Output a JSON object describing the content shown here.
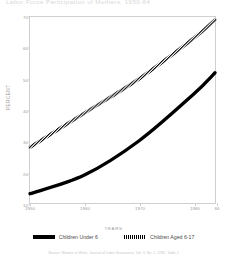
{
  "title": "Labor Force Participation of Mothers, 1950-84",
  "chart_data": {
    "type": "line",
    "title": "Labor Force Participation of Mothers, 1950-84",
    "xlabel": "YEARS",
    "ylabel": "PERCENT",
    "xlim": [
      1950,
      1984
    ],
    "ylim": [
      10,
      70
    ],
    "ytick_values": [
      70,
      60,
      50,
      40,
      30,
      20,
      10
    ],
    "ytick_labels": [
      "70",
      "60",
      "50",
      "40",
      "30",
      "20",
      "10"
    ],
    "xtick_values": [
      1950,
      1960,
      1970,
      1980,
      1984
    ],
    "xtick_labels": [
      "1950",
      "1960",
      "1970",
      "1980",
      "84"
    ],
    "grid": false,
    "legend_position": "bottom",
    "x": [
      1950,
      1960,
      1970,
      1980,
      1984
    ],
    "series": [
      {
        "name": "Children Under 6",
        "style": "solid",
        "color": "#000000",
        "values": [
          13,
          19,
          30,
          45,
          52
        ]
      },
      {
        "name": "Children Aged 6-17",
        "style": "hatched",
        "color": "#000000",
        "values": [
          28,
          39,
          50,
          63,
          69
        ]
      }
    ]
  },
  "legend": {
    "items": [
      {
        "label": "Children Under 6",
        "swatch": "solid-bar-icon"
      },
      {
        "label": "Children Aged 6-17",
        "swatch": "hatched-bar-icon"
      }
    ]
  },
  "source": "Source: Women at Work, Journal of Labor Economics, Vol. 3, No. 1, 1985, Table 1"
}
